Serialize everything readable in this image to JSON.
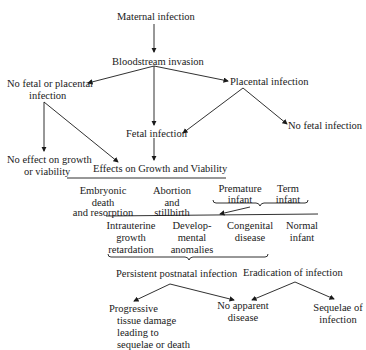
{
  "nodes": {
    "maternal_infection": "Maternal infection",
    "bloodstream_invasion": "Bloodstream invasion",
    "no_fetal_placental_1": "No fetal or placental",
    "no_fetal_placental_2": "infection",
    "placental_infection": "Placental infection",
    "fetal_infection": "Fetal infection",
    "no_fetal_infection": "No fetal infection",
    "no_effect_1": "No effect on growth",
    "no_effect_2": "or viability",
    "effects_title": "Effects on Growth and Viability",
    "embryonic_1": "Embryonic",
    "embryonic_2": "death",
    "embryonic_3": "and resorption",
    "abortion_1": "Abortion",
    "abortion_2": "and",
    "abortion_3": "stillbirth",
    "premature_1": "Premature",
    "premature_2": "infant",
    "term_1": "Term",
    "term_2": "infant",
    "iugr_1": "Intrauterine",
    "iugr_2": "growth",
    "iugr_3": "retardation",
    "dev_1": "Develop-",
    "dev_2": "mental",
    "dev_3": "anomalies",
    "congenital_1": "Congenital",
    "congenital_2": "disease",
    "normal_1": "Normal",
    "normal_2": "infant",
    "persistent": "Persistent postnatal infection",
    "eradication": "Eradication of infection",
    "progressive_1": "Progressive",
    "progressive_2": "tissue damage",
    "progressive_3": "leading to",
    "progressive_4": "sequelae or death",
    "no_apparent_1": "No apparent",
    "no_apparent_2": "disease",
    "sequelae_1": "Sequelae of",
    "sequelae_2": "infection"
  }
}
